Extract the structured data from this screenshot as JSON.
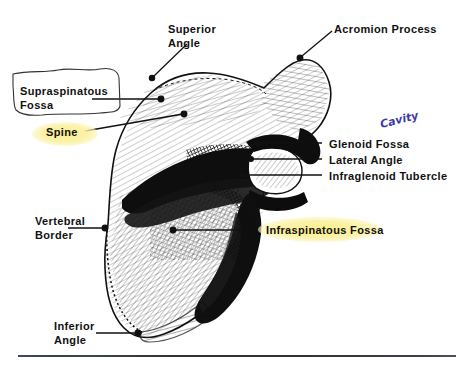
{
  "figure": {
    "view": "posterior",
    "background_color": "#ffffff",
    "ink_color": "#111111",
    "highlight_color": "#faed8a",
    "handwriting_color": "#3b3ba8"
  },
  "labels": [
    {
      "id": "superior-angle",
      "text_line1": "Superior",
      "text_line2": "Angle",
      "highlighted": false,
      "leader": "diagonal-down-left"
    },
    {
      "id": "acromion-process",
      "text_line1": "Acromion Process",
      "text_line2": "",
      "highlighted": false,
      "leader": "diagonal-down-left"
    },
    {
      "id": "supraspinatous-fossa",
      "text_line1": "Supraspinatous",
      "text_line2": "Fossa",
      "highlighted": false,
      "boxed": true,
      "leader": "horizontal-right"
    },
    {
      "id": "spine",
      "text_line1": "Spine",
      "text_line2": "",
      "highlighted": true,
      "leader": "diagonal-up-right"
    },
    {
      "id": "glenoid-fossa",
      "text_line1": "Glenoid Fossa",
      "text_line2": "",
      "highlighted": false,
      "leader": "horizontal-left"
    },
    {
      "id": "lateral-angle",
      "text_line1": "Lateral Angle",
      "text_line2": "",
      "highlighted": false,
      "leader": "horizontal-left"
    },
    {
      "id": "infraglenoid-tubercle",
      "text_line1": "Infraglenoid Tubercle",
      "text_line2": "",
      "highlighted": false,
      "leader": "horizontal-left"
    },
    {
      "id": "vertebral-border",
      "text_line1": "Vertebral",
      "text_line2": "Border",
      "highlighted": false,
      "leader": "horizontal-right"
    },
    {
      "id": "infraspinatous-fossa",
      "text_line1": "Infraspinatous Fossa",
      "text_line2": "",
      "highlighted": true,
      "leader": "horizontal-left"
    },
    {
      "id": "inferior-angle",
      "text_line1": "Inferior",
      "text_line2": "Angle",
      "highlighted": false,
      "leader": "horizontal-right"
    }
  ],
  "annotation": {
    "text": "Cavity",
    "style": "handwritten-blue-pen",
    "relates_to": "glenoid-fossa"
  }
}
